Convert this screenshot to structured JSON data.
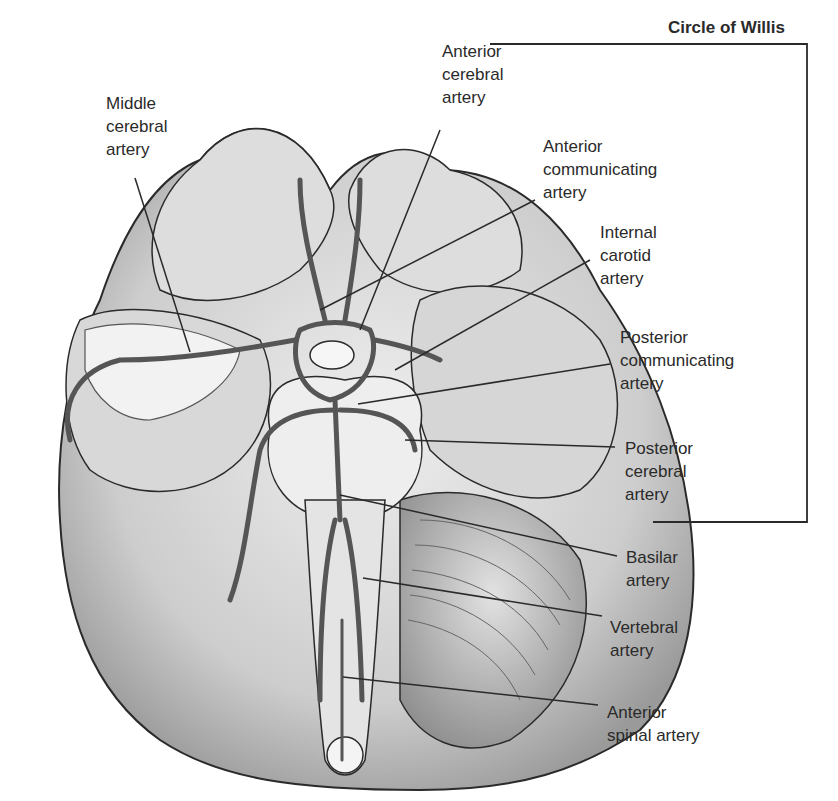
{
  "title": "Circle of Willis",
  "labels": {
    "middle_cerebral": "Middle\ncerebral\nartery",
    "anterior_cerebral": "Anterior\ncerebral\nartery",
    "anterior_communicating": "Anterior\ncommunicating\nartery",
    "internal_carotid": "Internal\ncarotid\nartery",
    "posterior_communicating": "Posterior\ncommunicating\nartery",
    "posterior_cerebral": "Posterior\ncerebral\nartery",
    "basilar": "Basilar\nartery",
    "vertebral": "Vertebral\nartery",
    "anterior_spinal": "Anterior\nspinal artery"
  },
  "colors": {
    "brain_fill": "#cfcfcf",
    "brain_light": "#eaeaea",
    "vessel": "#555555",
    "outline": "#2a2a2a",
    "text": "#2a2a2a"
  }
}
